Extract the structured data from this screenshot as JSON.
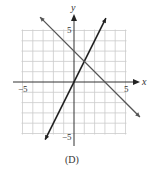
{
  "chart_data": {
    "type": "line",
    "title": "",
    "caption": "(D)",
    "xlabel": "x",
    "ylabel": "y",
    "xlim": [
      -5,
      5
    ],
    "ylim": [
      -5,
      5
    ],
    "grid": true,
    "grid_step": 1,
    "x_tick_labels": [
      {
        "value": -5,
        "label": "−5"
      },
      {
        "value": 5,
        "label": "5"
      }
    ],
    "y_tick_labels": [
      {
        "value": 5,
        "label": "5"
      },
      {
        "value": -5,
        "label": "−5"
      }
    ],
    "series": [
      {
        "name": "line-1",
        "equation": "y = 2x",
        "slope": 2,
        "intercept": 0,
        "x_range": [
          -2.8,
          3.1
        ],
        "color": "#222222",
        "arrows": "both"
      },
      {
        "name": "line-2",
        "equation": "y = -x + 3",
        "slope": -1,
        "intercept": 3,
        "x_range": [
          -3.3,
          6.4
        ],
        "color": "#555555",
        "arrows": "both"
      }
    ],
    "intersection": {
      "x": 1,
      "y": 2
    }
  },
  "labels": {
    "x_axis": "x",
    "y_axis": "y",
    "x_min": "−5",
    "x_max": "5",
    "y_max": "5",
    "y_min": "−5",
    "caption": "(D)"
  },
  "colors": {
    "grid": "#cccccc",
    "axis": "#333333",
    "line1": "#222222",
    "line2": "#555555"
  }
}
